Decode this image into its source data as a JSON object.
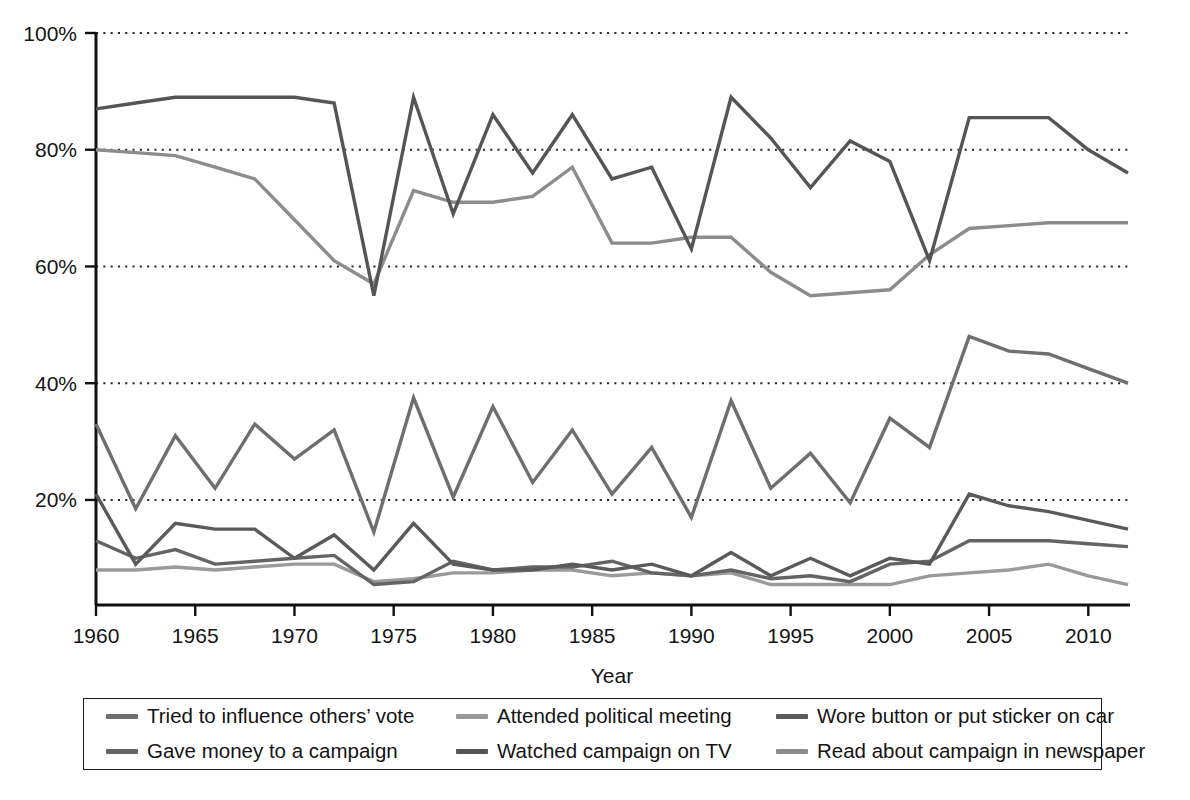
{
  "figure": {
    "top_cut_text": "",
    "background": "#ffffff",
    "axis_color": "#111111",
    "grid_color": "#2b2b2b"
  },
  "axes": {
    "y_ticks": [
      "20%",
      "40%",
      "60%",
      "80%",
      "100%"
    ],
    "y_tick_values": [
      20,
      40,
      60,
      80,
      100
    ],
    "x_ticks": [
      "1960",
      "1965",
      "1970",
      "1975",
      "1980",
      "1985",
      "1990",
      "1995",
      "2000",
      "2005",
      "2010"
    ],
    "x_tick_values": [
      1960,
      1965,
      1970,
      1975,
      1980,
      1985,
      1990,
      1995,
      2000,
      2005,
      2010
    ],
    "x_title": "Year",
    "y_title": ""
  },
  "legend": {
    "position": "below-plot",
    "items": [
      {
        "label": "Tried to influence others’ vote",
        "color": "#6e6e6e",
        "series_key": "influence"
      },
      {
        "label": "Attended political meeting",
        "color": "#9a9a9a",
        "series_key": "meeting"
      },
      {
        "label": "Wore button or put sticker on car",
        "color": "#5a5a5a",
        "series_key": "button"
      },
      {
        "label": "Gave money to a campaign",
        "color": "#646464",
        "series_key": "money"
      },
      {
        "label": "Watched campaign on TV",
        "color": "#555555",
        "series_key": "tv"
      },
      {
        "label": "Read about campaign in newspaper",
        "color": "#8c8c8c",
        "series_key": "newspaper"
      }
    ]
  },
  "chart_data": {
    "type": "line",
    "title": "",
    "xlabel": "Year",
    "ylabel": "",
    "xlim": [
      1960,
      2012
    ],
    "ylim": [
      2,
      100
    ],
    "grid": "horizontal-dotted",
    "legend_position": "bottom",
    "x": [
      1960,
      1962,
      1964,
      1966,
      1968,
      1970,
      1972,
      1974,
      1976,
      1978,
      1980,
      1982,
      1984,
      1986,
      1988,
      1990,
      1992,
      1994,
      1996,
      1998,
      2000,
      2002,
      2004,
      2006,
      2008,
      2010,
      2012
    ],
    "series": [
      {
        "name": "Watched campaign on TV",
        "key": "tv",
        "color": "#555555",
        "values": [
          87,
          88,
          89,
          89,
          89,
          89,
          88,
          55,
          89,
          69,
          86,
          76,
          86,
          75,
          77,
          63,
          89,
          82,
          73.5,
          81.5,
          78,
          61,
          85.5,
          85.5,
          85.5,
          80,
          76
        ]
      },
      {
        "name": "Read about campaign in newspaper",
        "key": "newspaper",
        "color": "#8c8c8c",
        "values": [
          80,
          79.5,
          79,
          77,
          75,
          68,
          61,
          57,
          73,
          71,
          71,
          72,
          77,
          64,
          64,
          65,
          65,
          59,
          55,
          55.5,
          56,
          62,
          66.5,
          67,
          67.5,
          67.5,
          67.5
        ]
      },
      {
        "name": "Tried to influence others’ vote",
        "key": "influence",
        "color": "#6e6e6e",
        "values": [
          33,
          18.5,
          31,
          22,
          33,
          27,
          32,
          14.5,
          37.5,
          20.5,
          36,
          23,
          32,
          21,
          29,
          17,
          37,
          22,
          28,
          19.5,
          34,
          29,
          48,
          45.5,
          45,
          42.5,
          40
        ]
      },
      {
        "name": "Wore button or put sticker on car",
        "key": "button",
        "color": "#5a5a5a",
        "values": [
          21,
          9,
          16,
          15,
          15,
          10,
          14,
          8,
          16,
          9,
          8,
          8,
          9,
          8,
          9,
          7,
          11,
          7,
          10,
          7,
          10,
          9,
          21,
          19,
          18,
          16.5,
          15
        ]
      },
      {
        "name": "Gave money to a campaign",
        "key": "money",
        "color": "#646464",
        "values": [
          13,
          10,
          11.5,
          9,
          9.5,
          10,
          10.5,
          5.5,
          6,
          9.5,
          8,
          8.5,
          8.5,
          9.5,
          7.5,
          7,
          8,
          6.5,
          7,
          6,
          9,
          9.5,
          13,
          13,
          13,
          12.5,
          12
        ]
      },
      {
        "name": "Attended political meeting",
        "key": "meeting",
        "color": "#9a9a9a",
        "values": [
          8,
          8,
          8.5,
          8,
          8.5,
          9,
          9,
          6,
          6.5,
          7.5,
          7.5,
          8,
          8,
          7,
          7.5,
          7,
          7.5,
          5.5,
          5.5,
          5.5,
          5.5,
          7,
          7.5,
          8,
          9,
          7,
          5.5
        ]
      }
    ]
  }
}
